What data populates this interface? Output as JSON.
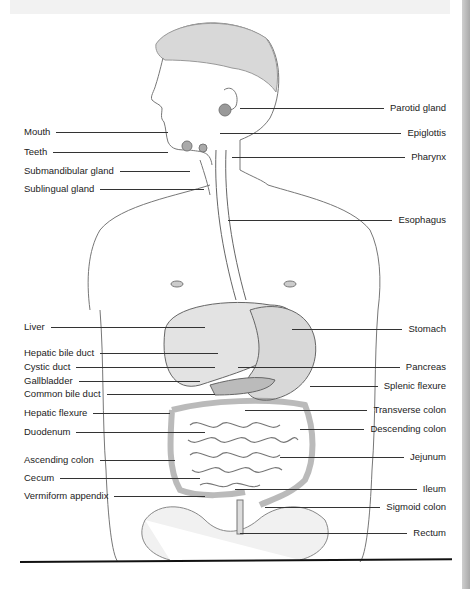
{
  "figure": {
    "colors": {
      "line": "#333333",
      "text": "#222222",
      "sketch": "#666666",
      "organ_shade": "#bdbdbd"
    },
    "labels_left": [
      {
        "text": "Mouth",
        "y": 132,
        "line_to": 168
      },
      {
        "text": "Teeth",
        "y": 152,
        "line_to": 168
      },
      {
        "text": "Submandibular gland",
        "y": 171,
        "line_to": 190
      },
      {
        "text": "Sublingual gland",
        "y": 189,
        "line_to": 204
      },
      {
        "text": "Liver",
        "y": 327,
        "line_to": 205
      },
      {
        "text": "Hepatic bile duct",
        "y": 353,
        "line_to": 218
      },
      {
        "text": "Cystic duct",
        "y": 367,
        "line_to": 215
      },
      {
        "text": "Gallbladder",
        "y": 381,
        "line_to": 200
      },
      {
        "text": "Common bile duct",
        "y": 394,
        "line_to": 215
      },
      {
        "text": "Hepatic flexure",
        "y": 413,
        "line_to": 170
      },
      {
        "text": "Duodenum",
        "y": 432,
        "line_to": 205
      },
      {
        "text": "Ascending colon",
        "y": 460,
        "line_to": 175
      },
      {
        "text": "Cecum",
        "y": 478,
        "line_to": 200
      },
      {
        "text": "Vermiform appendix",
        "y": 496,
        "line_to": 205
      }
    ],
    "labels_right": [
      {
        "text": "Parotid gland",
        "y": 108,
        "line_from": 240
      },
      {
        "text": "Epiglottis",
        "y": 133,
        "line_from": 220
      },
      {
        "text": "Pharynx",
        "y": 157,
        "line_from": 232
      },
      {
        "text": "Esophagus",
        "y": 220,
        "line_from": 228
      },
      {
        "text": "Stomach",
        "y": 329,
        "line_from": 292
      },
      {
        "text": "Pancreas",
        "y": 367,
        "line_from": 238
      },
      {
        "text": "Splenic flexure",
        "y": 386,
        "line_from": 310
      },
      {
        "text": "Transverse colon",
        "y": 410,
        "line_from": 245
      },
      {
        "text": "Descending colon",
        "y": 429,
        "line_from": 300
      },
      {
        "text": "Jejunum",
        "y": 457,
        "line_from": 280
      },
      {
        "text": "Ileum",
        "y": 489,
        "line_from": 235
      },
      {
        "text": "Sigmoid colon",
        "y": 507,
        "line_from": 265
      },
      {
        "text": "Rectum",
        "y": 533,
        "line_from": 240
      }
    ]
  }
}
